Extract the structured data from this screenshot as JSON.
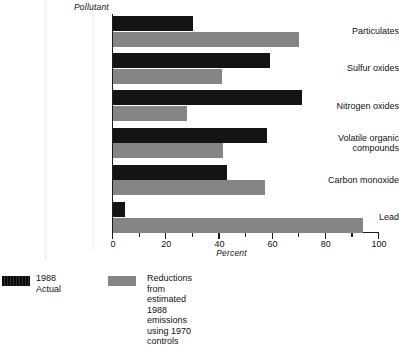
{
  "chart_data": {
    "type": "bar",
    "orientation": "horizontal",
    "title": "",
    "xlabel": "Percent",
    "ylabel": "Pollutant",
    "xlim": [
      0,
      100
    ],
    "xticks": [
      0,
      20,
      40,
      60,
      80,
      100
    ],
    "xtick_labels": [
      "0",
      "20",
      "40",
      "60",
      "80",
      "100"
    ],
    "minor_tick_interval": 10,
    "grid": false,
    "legend_position": "below",
    "categories": [
      "Particulates",
      "Sulfur oxides",
      "Nitrogen oxides",
      "Volatile organic\ncompounds",
      "Carbon monoxide",
      "Lead"
    ],
    "series": [
      {
        "name": "1988 Actual",
        "color": "#141414",
        "values": [
          30,
          59,
          71,
          58,
          43,
          4.5
        ]
      },
      {
        "name": "Reductions from estimated 1988 emissions using 1970 controls",
        "color": "#858585",
        "values": [
          70,
          41,
          28,
          41.5,
          57,
          94
        ]
      }
    ]
  },
  "axes": {
    "y_axis_title": "Pollutant",
    "x_axis_title": "Percent"
  },
  "legend": {
    "entries": [
      {
        "label": "1988 Actual",
        "swatch": "black-swatch"
      },
      {
        "label": "Reductions from estimated 1988\nemissions using 1970 controls",
        "swatch": "gray-swatch"
      }
    ]
  }
}
